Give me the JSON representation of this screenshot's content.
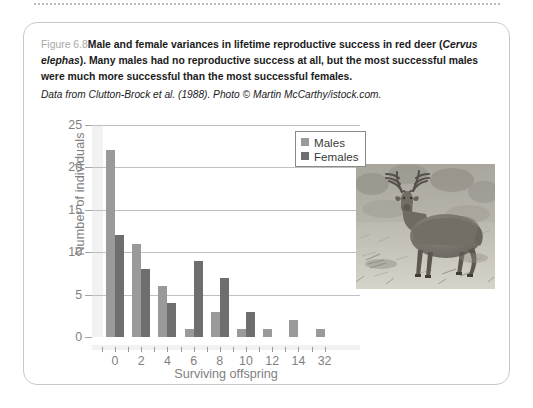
{
  "figure": {
    "number": "Figure 6.8",
    "caption_main": "Male and female variances in lifetime reproductive success in red deer (",
    "caption_species": "Cervus elephas",
    "caption_rest": "). Many males had no reproductive success at all, but the most successful males were much more successful than the most successful females.",
    "source": "Data from Clutton-Brock et al. (1988). Photo © Martin McCarthy/istock.com."
  },
  "photo": {
    "alt": "red-deer-stag-photo",
    "caption": "Red deer stag standing in grassland"
  },
  "colors": {
    "males": "#9a9a9a",
    "females": "#6e6e6e",
    "axis_text": "#7f7f7f",
    "gridline": "#c0c0c0",
    "card_border": "#c9c9c9"
  },
  "chart_data": {
    "type": "bar",
    "title": "",
    "xlabel": "Surviving offspring",
    "ylabel": "Number of individuals",
    "categories": [
      "0",
      "2",
      "4",
      "6",
      "8",
      "10",
      "12",
      "14",
      "32"
    ],
    "series": [
      {
        "name": "Males",
        "values": [
          22,
          11,
          6,
          1,
          3,
          1,
          1,
          2,
          1
        ]
      },
      {
        "name": "Females",
        "values": [
          12,
          8,
          4,
          9,
          7,
          3,
          0,
          0,
          0
        ]
      }
    ],
    "ylim": [
      0,
      25
    ],
    "yticks": [
      0,
      5,
      10,
      15,
      20,
      25
    ],
    "ytick_labels": [
      "0",
      "5",
      "10",
      "15",
      "20",
      "25"
    ],
    "grid": "horizontal",
    "legend_position": "top-right",
    "legend_entries": [
      "Males",
      "Females"
    ]
  }
}
